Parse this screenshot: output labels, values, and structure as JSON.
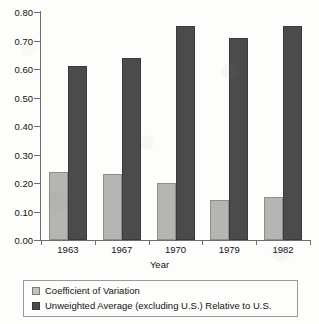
{
  "chart_data": {
    "type": "bar",
    "title": "",
    "subtitle": "",
    "xlabel": "Year",
    "ylabel": "",
    "categories": [
      "1963",
      "1967",
      "1970",
      "1979",
      "1982"
    ],
    "series": [
      {
        "name": "Coefficient of Variation",
        "color": "#b5b5b4",
        "values": [
          0.24,
          0.23,
          0.2,
          0.14,
          0.15
        ]
      },
      {
        "name": "Unweighted Average (excluding U.S.) Relative to U.S.",
        "color": "#4b4b4b",
        "values": [
          0.61,
          0.64,
          0.75,
          0.71,
          0.75
        ]
      }
    ],
    "ylim": [
      0.0,
      0.8
    ],
    "yticks": [
      "0.00",
      "0.10",
      "0.20",
      "0.30",
      "0.40",
      "0.50",
      "0.60",
      "0.70",
      "0.80"
    ],
    "ytick_values": [
      0.0,
      0.1,
      0.2,
      0.3,
      0.4,
      0.5,
      0.6,
      0.7,
      0.8
    ],
    "grid": false,
    "legend_position": "bottom"
  },
  "legend": {
    "items": [
      {
        "label": "Coefficient of Variation",
        "swatch": "light-gray-square"
      },
      {
        "label": "Unweighted Average (excluding U.S.) Relative to U.S.",
        "swatch": "dark-gray-square"
      }
    ]
  },
  "axis": {
    "x_title": "Year"
  }
}
